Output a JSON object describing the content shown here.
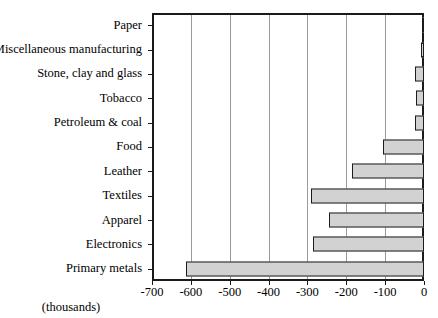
{
  "chart_data": {
    "type": "bar",
    "orientation": "horizontal",
    "title": "",
    "xlabel": "(thousands)",
    "ylabel": "",
    "xlim": [
      -700,
      0
    ],
    "xticks": [
      -700,
      -600,
      -500,
      -400,
      -300,
      -200,
      -100,
      0
    ],
    "xtick_labels": [
      "-700",
      "-600",
      "-500",
      "-400",
      "-300",
      "-200",
      "-100",
      "0"
    ],
    "grid": true,
    "grid_axis": "x",
    "legend": null,
    "categories": [
      "Paper",
      "Miscellaneous manufacturing",
      "Stone, clay and glass",
      "Tobacco",
      "Petroleum & coal",
      "Food",
      "Leather",
      "Textiles",
      "Apparel",
      "Electronics",
      "Primary metals"
    ],
    "values": [
      -6,
      -7,
      -22,
      -21,
      -22,
      -105,
      -186,
      -290,
      -245,
      -285,
      -612
    ],
    "bar_fill_color": "#d2d2d2",
    "bar_edge_color": "#1c1c1c",
    "axis_color": "#1a1a1a",
    "grid_color": "#9a9a9a",
    "background_color": "#ffffff"
  }
}
